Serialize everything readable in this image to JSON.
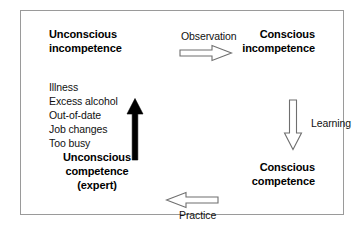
{
  "diagram": {
    "type": "competence-matrix",
    "quadrants": [
      {
        "name": "unconscious-incompetence",
        "position": "top-left",
        "lines": [
          "Unconscious",
          "incompetence"
        ]
      },
      {
        "name": "conscious-incompetence",
        "position": "top-right",
        "lines": [
          "Conscious",
          "incompetence"
        ]
      },
      {
        "name": "unconscious-competence",
        "position": "bottom-left",
        "lines": [
          "Unconscious",
          "competence",
          "(expert)"
        ]
      },
      {
        "name": "conscious-competence",
        "position": "bottom-right",
        "lines": [
          "Conscious",
          "competence"
        ]
      }
    ],
    "transitions": [
      {
        "name": "observation",
        "label": "Observation",
        "direction": "right",
        "style": "outline",
        "from": "unconscious-incompetence",
        "to": "conscious-incompetence"
      },
      {
        "name": "learning",
        "label": "Learning",
        "direction": "down",
        "style": "outline",
        "from": "conscious-incompetence",
        "to": "conscious-competence"
      },
      {
        "name": "practice",
        "label": "Practice",
        "direction": "left",
        "style": "outline",
        "from": "conscious-competence",
        "to": "unconscious-competence"
      },
      {
        "name": "regression",
        "label": "",
        "direction": "up",
        "style": "solid",
        "from": "unconscious-competence",
        "to": "unconscious-incompetence"
      }
    ],
    "regression_causes": {
      "items": [
        "Illness",
        "Excess alcohol",
        "Out-of-date",
        "Job changes",
        "Too busy"
      ]
    },
    "colors": {
      "border": "#9a9a9a",
      "text": "#000000",
      "arrow_outline": "#6f6f6f",
      "arrow_solid": "#000000",
      "background": "#ffffff"
    }
  }
}
